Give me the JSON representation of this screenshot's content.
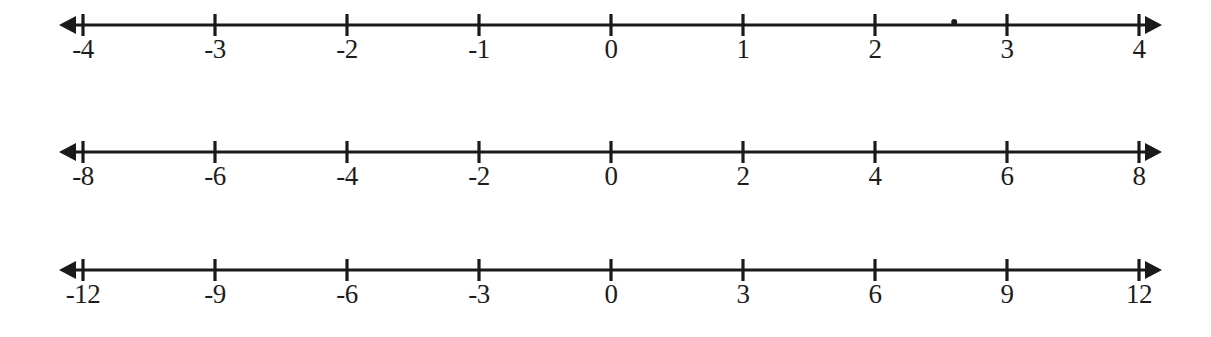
{
  "page": {
    "background_color": "#ffffff",
    "ink_color": "#1a1a1a",
    "width": 1211,
    "height": 337
  },
  "chart_data": {
    "type": "line",
    "xlabel": "",
    "ylabel": "",
    "grid": false,
    "legend": null,
    "lines": [
      {
        "name": "number-line-1",
        "interval": 1,
        "xlim": [
          -4,
          4
        ],
        "tick_values": [
          -4,
          -3,
          -2,
          -1,
          0,
          1,
          2,
          3,
          4
        ],
        "tick_labels": [
          "-4",
          "-3",
          "-2",
          "-1",
          "0",
          "1",
          "2",
          "3",
          "4"
        ],
        "left_arrow": true,
        "right_arrow": true,
        "marks": [
          {
            "name": "stray-dot",
            "value": 2.6
          }
        ]
      },
      {
        "name": "number-line-2",
        "interval": 2,
        "xlim": [
          -8,
          8
        ],
        "tick_values": [
          -8,
          -6,
          -4,
          -2,
          0,
          2,
          4,
          6,
          8
        ],
        "tick_labels": [
          "-8",
          "-6",
          "-4",
          "-2",
          "0",
          "2",
          "4",
          "6",
          "8"
        ],
        "left_arrow": true,
        "right_arrow": true,
        "marks": []
      },
      {
        "name": "number-line-3",
        "interval": 3,
        "xlim": [
          -12,
          12
        ],
        "tick_values": [
          -12,
          -9,
          -6,
          -3,
          0,
          3,
          6,
          9,
          12
        ],
        "tick_labels": [
          "-12",
          "-9",
          "-6",
          "-3",
          "0",
          "3",
          "6",
          "9",
          "12"
        ],
        "left_arrow": true,
        "right_arrow": true,
        "marks": []
      }
    ]
  },
  "geometry": {
    "first_tick_x": 83,
    "tick_spacing": 132,
    "axis_y": 25,
    "tick_half_height": 11,
    "arrow_left_tip_x": 59,
    "arrow_right_tip_x": 1162,
    "label_y": 36,
    "stroke_width": 3.2
  }
}
